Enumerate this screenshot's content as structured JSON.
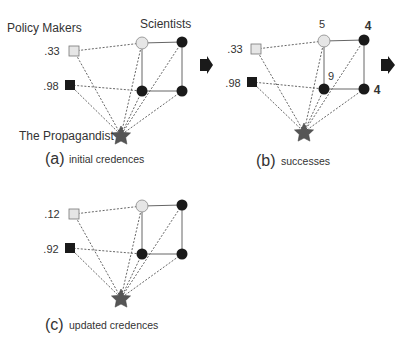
{
  "labels": {
    "policy_makers": "Policy Makers",
    "scientists": "Scientists",
    "propagandist": "The Propagandist"
  },
  "panels": [
    {
      "id": "a",
      "letter": "(a)",
      "caption": "initial credences",
      "policy_credences": [
        ".33",
        ".98"
      ],
      "scientist_counts": []
    },
    {
      "id": "b",
      "letter": "(b)",
      "caption": "successes",
      "policy_credences": [
        ".33",
        ".98"
      ],
      "scientist_counts": [
        "5",
        "4",
        "9",
        "4"
      ]
    },
    {
      "id": "c",
      "letter": "(c)",
      "caption": "updated credences",
      "policy_credences": [
        ".12",
        ".92"
      ],
      "scientist_counts": []
    }
  ],
  "colors": {
    "light_node": "#e6e6e6",
    "dark_node": "#1a1a1a",
    "star": "#555555",
    "edge": "#555555",
    "arrow": "#1a1a1a"
  }
}
